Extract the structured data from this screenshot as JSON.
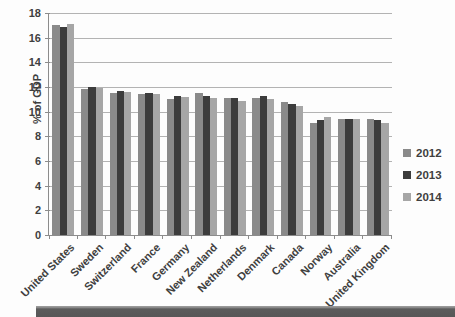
{
  "chart": {
    "background": "#fdfdfd",
    "gridline_color": "#b3b3b3",
    "axis_color": "#8c8c8c",
    "text_color": "#3f3f3f",
    "bottom_band_color": "#5c5c5c"
  },
  "chart_data": {
    "type": "bar",
    "title": "",
    "xlabel": "",
    "ylabel": "% of GDP",
    "ylim": [
      0,
      18
    ],
    "ytick_step": 2,
    "grid": true,
    "legend_position": "right",
    "categories": [
      "United States",
      "Sweden",
      "Switzerland",
      "France",
      "Germany",
      "New Zealand",
      "Netherlands",
      "Denmark",
      "Canada",
      "Norway",
      "Australia",
      "United Kingdom"
    ],
    "series": [
      {
        "name": "2012",
        "color": "#8a8a8a",
        "values": [
          17.0,
          11.8,
          11.5,
          11.4,
          11.0,
          11.5,
          11.1,
          11.1,
          10.8,
          9.1,
          9.4,
          9.4
        ]
      },
      {
        "name": "2013",
        "color": "#3c3c3c",
        "values": [
          16.9,
          12.0,
          11.7,
          11.5,
          11.3,
          11.3,
          11.1,
          11.3,
          10.6,
          9.3,
          9.4,
          9.3
        ]
      },
      {
        "name": "2014",
        "color": "#a6a6a6",
        "values": [
          17.1,
          11.9,
          11.6,
          11.4,
          11.2,
          11.1,
          10.9,
          11.0,
          10.5,
          9.6,
          9.4,
          9.1
        ]
      }
    ]
  }
}
